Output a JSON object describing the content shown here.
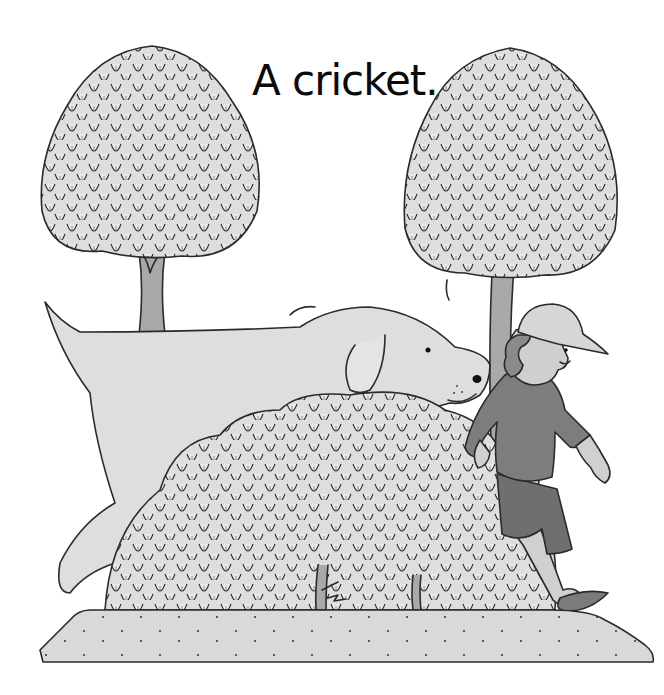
{
  "page": {
    "caption": "A cricket."
  },
  "illustration": {
    "style": "grayscale pencil",
    "elements": [
      "left-tree",
      "right-tree",
      "dog",
      "bush",
      "boy",
      "cricket",
      "ground"
    ],
    "colors": {
      "background": "#ffffff",
      "ink": "#2a2a2a",
      "foliage": "#dcdcdc",
      "trunk": "#a9a9a9",
      "dog": "#dedede",
      "shirt": "#7d7d7d",
      "shorts": "#6f6f6f",
      "skin": "#cfcfcf",
      "hat": "#d6d6d6",
      "hair": "#8a8a8a",
      "ground": "#d9d9d9"
    }
  }
}
